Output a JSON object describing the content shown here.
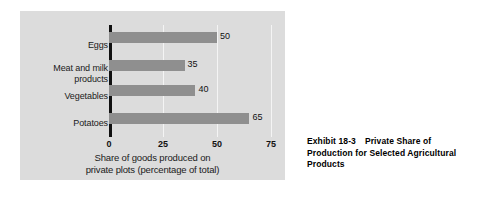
{
  "chart_data": {
    "type": "bar",
    "orientation": "horizontal",
    "categories": [
      "Eggs",
      "Meat and milk products",
      "Vegetables",
      "Potatoes"
    ],
    "values": [
      50,
      35,
      40,
      65
    ],
    "value_labels": [
      "50",
      "35",
      "40",
      "65"
    ],
    "title": "",
    "xlabel": "Share of goods produced on private plots (percentage of total)",
    "xlabel_line1": "Share of goods produced on",
    "xlabel_line2": "private plots (percentage of total)",
    "ylabel": "",
    "xlim": [
      0,
      75
    ],
    "xticks": [
      0,
      25,
      50,
      75
    ],
    "xtick_labels": [
      "0",
      "25",
      "50",
      "75"
    ],
    "grid": "vertical-gridlines-at-xticks",
    "legend": "none",
    "bar_color": "#8f8f8f",
    "panel_color": "#dcdcdc",
    "gridline_color": "#f4f4f4",
    "axis_color": "#111111",
    "category_lines": [
      [
        "Eggs"
      ],
      [
        "Meat and milk",
        "products"
      ],
      [
        "Vegetables"
      ],
      [
        "Potatoes"
      ]
    ]
  },
  "caption": {
    "exhibit_number": "Exhibit 18-3",
    "title": "Private Share of Production for Selected Agricultural Products",
    "title_line1": "Private Share of",
    "title_line2": "Production for Selected Agricultural",
    "title_line3": "Products"
  }
}
